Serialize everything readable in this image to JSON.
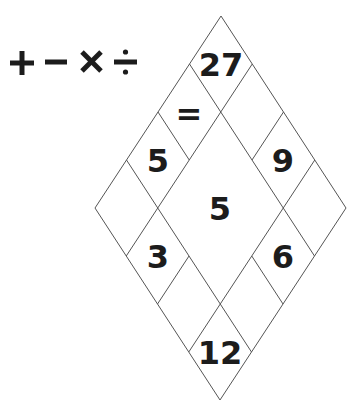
{
  "puzzle": {
    "operators": [
      {
        "symbol": "+",
        "name": "plus-icon"
      },
      {
        "symbol": "−",
        "name": "minus-icon"
      },
      {
        "symbol": "×",
        "name": "times-icon"
      },
      {
        "symbol": "÷",
        "name": "divide-icon"
      }
    ],
    "grid": {
      "size": 4,
      "center_merged": true,
      "line_color": "#555555",
      "text_color": "#1c1c1c",
      "cells": {
        "r0c0": "27",
        "r0c1": "",
        "r0c2": "9",
        "r0c3": "",
        "r1c0": "=",
        "r1c3": "6",
        "r2c0": "5",
        "r2c3": "",
        "r3c0": "",
        "r3c1": "3",
        "r3c2": "",
        "r3c3": "12",
        "center": "5"
      }
    }
  }
}
